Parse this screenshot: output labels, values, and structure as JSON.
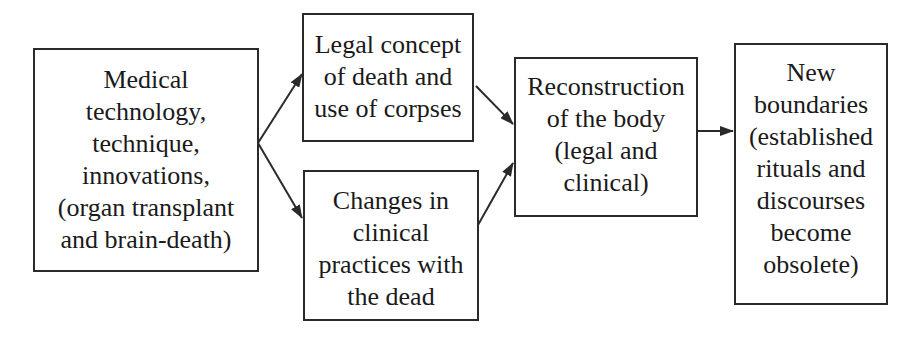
{
  "diagram": {
    "type": "flowchart",
    "nodes": [
      {
        "id": "medical",
        "label": "Medical\ntechnology,\ntechnique,\ninnovations,\n(organ transplant\nand brain-death)"
      },
      {
        "id": "legal",
        "label": "Legal concept\nof death and\nuse of corpses"
      },
      {
        "id": "clinical",
        "label": "Changes in\nclinical\npractices with\nthe dead"
      },
      {
        "id": "reconstruction",
        "label": "Reconstruction\nof the body\n(legal and\nclinical)"
      },
      {
        "id": "boundaries",
        "label": "New\nboundaries\n(established\nrituals and\ndiscourses\nbecome\nobsolete)"
      }
    ],
    "edges": [
      {
        "from": "medical",
        "to": "legal"
      },
      {
        "from": "medical",
        "to": "clinical"
      },
      {
        "from": "legal",
        "to": "reconstruction"
      },
      {
        "from": "clinical",
        "to": "reconstruction"
      },
      {
        "from": "reconstruction",
        "to": "boundaries"
      }
    ]
  },
  "colors": {
    "line": "#2a2a2a",
    "background": "#ffffff",
    "text": "#1a1a1a"
  }
}
